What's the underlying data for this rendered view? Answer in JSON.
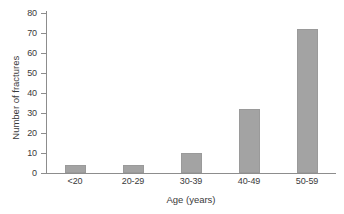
{
  "chart_data": {
    "type": "bar",
    "title": "",
    "subtitle": "",
    "categories": [
      "<20",
      "20-29",
      "30-39",
      "40-49",
      "50-59"
    ],
    "values": [
      4,
      4,
      10,
      32,
      72
    ],
    "xlabel": "Age (years)",
    "ylabel": "Number of fractures",
    "ylim": [
      0,
      80
    ],
    "yticks": [
      0,
      10,
      20,
      30,
      40,
      50,
      60,
      70,
      80
    ],
    "ytick_labels": [
      "0",
      "10",
      "20",
      "30",
      "40",
      "50",
      "60",
      "70",
      "80"
    ],
    "grid": false,
    "legend": false,
    "legend_position": "none",
    "bar_color": "#a3a3a3",
    "axis_color": "#8d8d8d",
    "text_color": "#3a3a3a",
    "background_color": "#ffffff"
  }
}
